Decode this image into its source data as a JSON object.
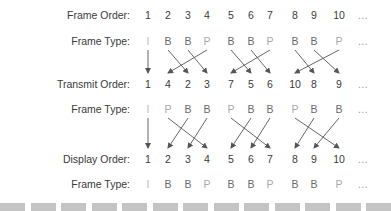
{
  "rows": [
    {
      "label": "Frame Order:",
      "y": 15,
      "kind": "num",
      "cells": [
        "1",
        "2",
        "3",
        "4",
        "5",
        "6",
        "7",
        "8",
        "9",
        "10",
        "..."
      ]
    },
    {
      "label": "Frame Type:",
      "y": 41,
      "kind": "type",
      "cells": [
        "I",
        "B",
        "B",
        "P",
        "B",
        "B",
        "P",
        "B",
        "B",
        "P",
        "..."
      ]
    },
    {
      "label": "Transmit Order:",
      "y": 84,
      "kind": "num",
      "cells": [
        "1",
        "4",
        "2",
        "3",
        "7",
        "5",
        "6",
        "10",
        "8",
        "9",
        "..."
      ]
    },
    {
      "label": "Frame Type:",
      "y": 109,
      "kind": "type",
      "cells": [
        "I",
        "P",
        "B",
        "B",
        "P",
        "B",
        "B",
        "P",
        "B",
        "B",
        "..."
      ]
    },
    {
      "label": "Display Order:",
      "y": 159,
      "kind": "num",
      "cells": [
        "1",
        "2",
        "3",
        "4",
        "5",
        "6",
        "7",
        "8",
        "9",
        "10",
        "..."
      ]
    },
    {
      "label": "Frame Type:",
      "y": 184,
      "kind": "type",
      "cells": [
        "I",
        "B",
        "B",
        "P",
        "B",
        "B",
        "P",
        "B",
        "B",
        "P",
        "..."
      ]
    }
  ],
  "columns_x": [
    148,
    168,
    188,
    207,
    231,
    251,
    270,
    295,
    314,
    339,
    363
  ],
  "stages": [
    {
      "name": "encode-reorder",
      "y1": 50,
      "y2": 73
    },
    {
      "name": "decode-reorder",
      "y1": 118,
      "y2": 148
    }
  ],
  "colors": {
    "text": "#3a3a3a",
    "frame_I": "#bdbdbd",
    "frame_P": "#a9a9a9",
    "frame_B": "#6a6a6a",
    "arrow": "#555555",
    "bar": "#c4c4c4"
  },
  "bars_count": 13
}
